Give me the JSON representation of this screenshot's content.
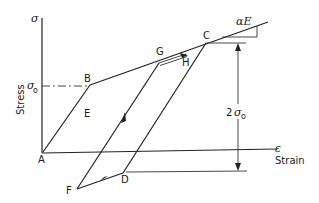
{
  "diagram": {
    "type": "stress-strain hysteresis (kinematic hardening)",
    "axes": {
      "y_symbol": "σ",
      "y_label": "Stress",
      "x_symbol": "ε",
      "x_label": "Strain",
      "yield_label": "σ",
      "yield_subscript": "o"
    },
    "points": {
      "A": "A",
      "B": "B",
      "C": "C",
      "D": "D",
      "E": "E",
      "F": "F",
      "G": "G",
      "H": "H"
    },
    "annotations": {
      "slope_label": "αE",
      "range_prefix": "2",
      "range_symbol": "σ",
      "range_subscript": "o"
    },
    "colors": {
      "line": "#222222",
      "background": "#ffffff"
    }
  }
}
